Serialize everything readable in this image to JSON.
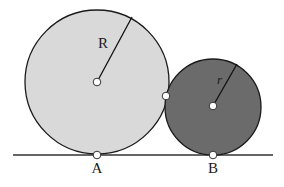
{
  "diagram": {
    "large_circle": {
      "cx": 97,
      "cy": 82,
      "r": 72,
      "fill": "#d9d9d9",
      "stroke": "#1a1a1a"
    },
    "small_circle": {
      "cx": 213,
      "cy": 106,
      "r": 48,
      "fill": "#6b6b6b",
      "stroke": "#1a1a1a"
    },
    "ground": {
      "x1": 13,
      "x2": 273,
      "y": 155,
      "stroke": "#333333"
    },
    "large_radius_end": {
      "x": 132,
      "y": 17
    },
    "small_radius_end": {
      "x": 237,
      "y": 64
    },
    "tangent_point": {
      "x": 166,
      "y": 96
    },
    "labels": {
      "R": "R",
      "r": "r",
      "A": "A",
      "B": "B"
    }
  }
}
